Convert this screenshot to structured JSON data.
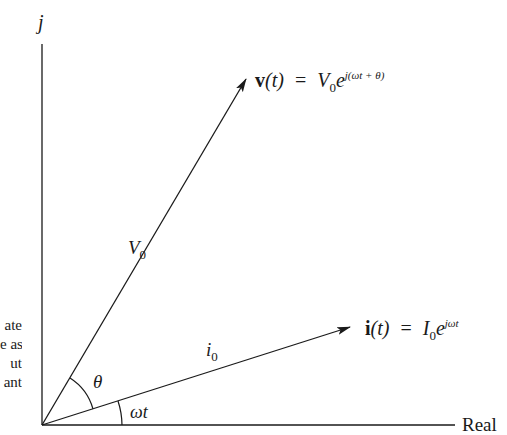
{
  "diagram": {
    "axes": {
      "vertical_label": "j",
      "horizontal_label": "Real"
    },
    "vectors": {
      "voltage": {
        "magnitude_label": "V",
        "magnitude_sub": "0",
        "equation_lhs": "v",
        "equation_arg": "(t)",
        "equation_eq": "=",
        "equation_amp": "V",
        "equation_amp_sub": "0",
        "equation_base": "e",
        "equation_exp": "j(ωt + θ)"
      },
      "current": {
        "magnitude_label": "i",
        "magnitude_sub": "0",
        "equation_lhs": "i",
        "equation_arg": "(t)",
        "equation_eq": "=",
        "equation_amp": "I",
        "equation_amp_sub": "0",
        "equation_base": "e",
        "equation_exp": "jωt"
      }
    },
    "angles": {
      "phase_label": "θ",
      "rotation_label": "ωt"
    },
    "cropped_side_text": [
      "ate",
      "e as",
      "ut",
      "ant"
    ],
    "colors": {
      "ink": "#1a1a1a",
      "background": "#ffffff"
    }
  }
}
